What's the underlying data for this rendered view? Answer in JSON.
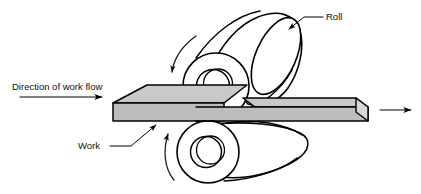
{
  "figure": {
    "background_color": "#ffffff",
    "line_color": "#000000"
  },
  "labels": {
    "roll": "Roll",
    "work": "Work",
    "direction_of_work_flow": "Direction of work flow"
  },
  "colors": {
    "slab_top_face": "#c9c9c9",
    "slab_front_face": "#bdbdbd",
    "roll_fill": "#ffffff",
    "outline": "#000000",
    "text": "#111111"
  },
  "components": {
    "top_roll": "roll-cylinder-top",
    "bottom_roll": "roll-cylinder-bottom",
    "workpiece_entry": "thick-slab-entering",
    "workpiece_exit": "thin-slab-exiting",
    "top_rotation_arrow": "rotation-arrow-clockwise",
    "bottom_rotation_arrow": "rotation-arrow-counterclockwise",
    "inlet_flow_arrow": "flow-arrow-right",
    "outlet_flow_arrow": "flow-arrow-right"
  }
}
